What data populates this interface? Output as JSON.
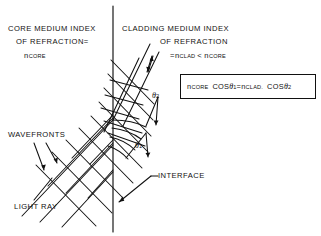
{
  "figure": {
    "background_color": "#ffffff",
    "line_color": "#111111",
    "width": 321,
    "height": 236
  },
  "labels": {
    "core_line1": "CORE MEDIUM INDEX",
    "core_line2": "OF REFRACTION=",
    "core_n_base": "n",
    "core_n_sub": "CORE",
    "clad_line1": "CLADDING MEDIUM INDEX",
    "clad_line2": "OF REFRACTION",
    "clad_eq_prefix": "=",
    "clad_n1_base": "n",
    "clad_n1_sub": "CLAD",
    "clad_compare": "<",
    "clad_n2_base": "n",
    "clad_n2_sub": "CORE",
    "wavefronts": "WAVEFRONTS",
    "light_ray": "LIGHT RAY",
    "interface": "INTERFACE",
    "theta1_base": "θ",
    "theta1_sub": "1",
    "theta2_base": "θ",
    "theta2_sub": "2"
  },
  "equation": {
    "full": "n_CORE COS θ_1 = n_CLAD COS θ_2",
    "n1_base": "n",
    "n1_sub": "CORE",
    "cos1": "COS",
    "theta1_base": "θ",
    "theta1_sub": "1",
    "equals": "=",
    "n2_base": "n",
    "n2_sub": "CLAD.",
    "cos2": "COS",
    "theta2_base": "θ",
    "theta2_sub": "2"
  },
  "geometry": {
    "interface_x": 113,
    "interface_top_y": 6,
    "interface_bottom_y": 232,
    "incidence_point_x": 113,
    "incidence_point_y": 120,
    "incident_ray_angle_deg": 45,
    "transmitted_ray_angle_deg": 70
  }
}
